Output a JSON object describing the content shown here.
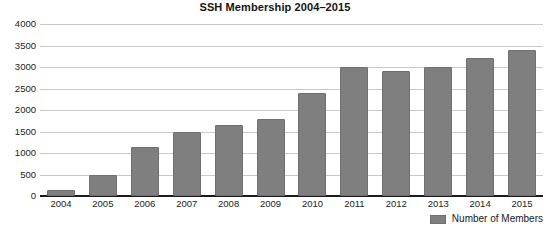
{
  "chart_data": {
    "type": "bar",
    "title": "SSH Membership 2004–2015",
    "xlabel": "",
    "ylabel": "",
    "categories": [
      "2004",
      "2005",
      "2006",
      "2007",
      "2008",
      "2009",
      "2010",
      "2011",
      "2012",
      "2013",
      "2014",
      "2015"
    ],
    "values": [
      150,
      500,
      1150,
      1500,
      1650,
      1800,
      2400,
      3000,
      2900,
      3000,
      3200,
      3400
    ],
    "series": [
      {
        "name": "Number of Members",
        "values": [
          150,
          500,
          1150,
          1500,
          1650,
          1800,
          2400,
          3000,
          2900,
          3000,
          3200,
          3400
        ]
      }
    ],
    "ylim": [
      0,
      4000
    ],
    "yticks": [
      0,
      500,
      1000,
      1500,
      2000,
      2500,
      3000,
      3500,
      4000
    ],
    "ytick_labels": [
      "0",
      "500",
      "1000",
      "1500",
      "2000",
      "2500",
      "3000",
      "3500",
      "4000"
    ],
    "grid": true,
    "legend": {
      "position": "bottom-right",
      "entries": [
        "Number of Members"
      ]
    },
    "colors": {
      "bar_fill": "#7f7f7f",
      "bar_border": "#6f6f6f",
      "gridline": "#c9c9c9",
      "axis": "#1b1b1b",
      "text": "#1a1a1a",
      "background": "#ffffff"
    }
  }
}
